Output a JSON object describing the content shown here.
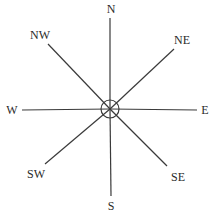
{
  "diagram": {
    "type": "compass-rose",
    "stroke_color": "#3a3a3a",
    "center": {
      "x": 110,
      "y": 109
    },
    "center_circle_radius": 9,
    "directions": [
      {
        "label": "N",
        "label_pos": [
          111,
          9
        ],
        "line_end": [
          110,
          18
        ]
      },
      {
        "label": "NE",
        "label_pos": [
          182,
          40
        ],
        "line_end": [
          174,
          49
        ]
      },
      {
        "label": "E",
        "label_pos": [
          205,
          110
        ],
        "line_end": [
          197,
          110
        ]
      },
      {
        "label": "SE",
        "label_pos": [
          178,
          177
        ],
        "line_end": [
          167,
          166
        ]
      },
      {
        "label": "S",
        "label_pos": [
          111,
          206
        ],
        "line_end": [
          111,
          196
        ]
      },
      {
        "label": "SW",
        "label_pos": [
          36,
          174
        ],
        "line_end": [
          45,
          164
        ]
      },
      {
        "label": "W",
        "label_pos": [
          12,
          110
        ],
        "line_end": [
          22,
          110
        ]
      },
      {
        "label": "NW",
        "label_pos": [
          40,
          35
        ],
        "line_end": [
          48,
          44
        ]
      }
    ]
  }
}
